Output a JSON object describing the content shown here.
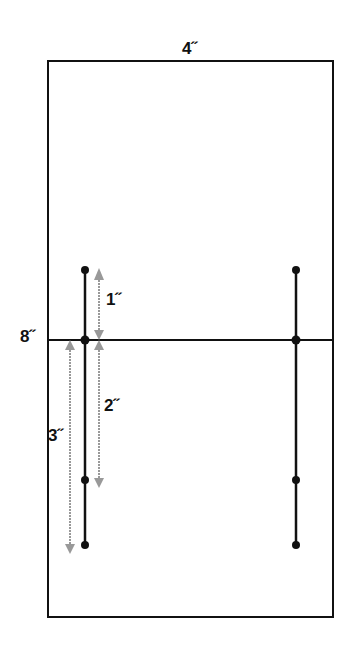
{
  "diagram": {
    "width_label": "4˝",
    "height_label": "8˝",
    "dim_1": "1˝",
    "dim_2": "2˝",
    "dim_3": "3˝",
    "colors": {
      "line": "#111111",
      "dimension": "#999999"
    }
  }
}
